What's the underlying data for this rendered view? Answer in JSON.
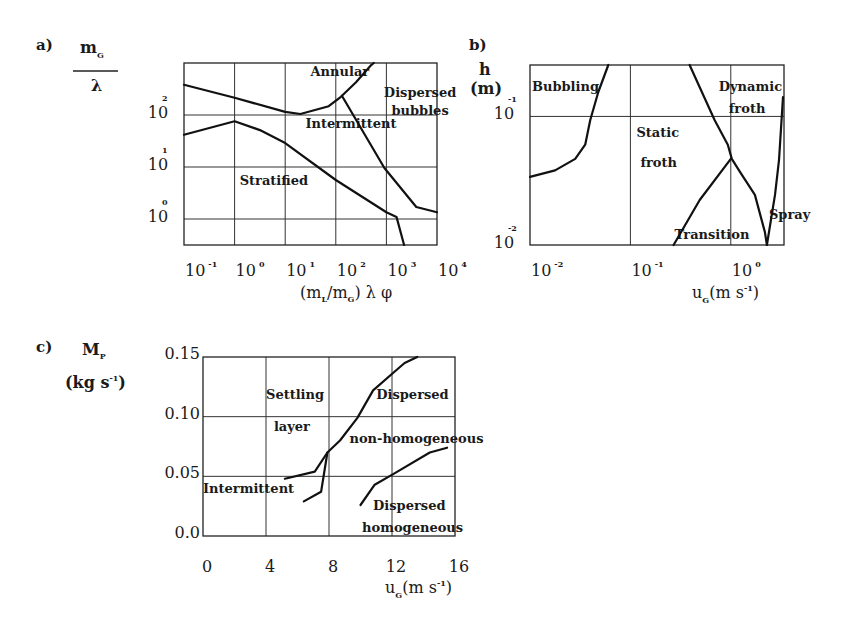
{
  "chart_data": [
    {
      "id": "a",
      "type": "line",
      "panel_label": "a)",
      "title": "",
      "xlabel": "(m_L/m_G) λ φ",
      "ylabel": "m_G / λ",
      "xscale": "log",
      "yscale": "log",
      "xlim_log10": [
        -1,
        4
      ],
      "ylim_log10": [
        -0.5,
        3.0
      ],
      "grid": true,
      "x_ticks": [
        {
          "base": "10",
          "exp": "-1",
          "log": -1
        },
        {
          "base": "10",
          "exp": "0",
          "log": 0
        },
        {
          "base": "10",
          "exp": "1",
          "log": 1
        },
        {
          "base": "10",
          "exp": "2",
          "log": 2
        },
        {
          "base": "10",
          "exp": "3",
          "log": 3
        },
        {
          "base": "10",
          "exp": "4",
          "log": 4
        }
      ],
      "y_ticks": [
        {
          "base": "10",
          "exp": "0",
          "log": 0
        },
        {
          "base": "10",
          "exp": "1",
          "log": 1
        },
        {
          "base": "10",
          "exp": "2",
          "log": 2
        }
      ],
      "series": [
        {
          "name": "annular-intermittent-boundary",
          "points_log10": [
            [
              -1,
              2.58
            ],
            [
              0,
              2.33
            ],
            [
              1,
              2.06
            ],
            [
              1.3,
              2.02
            ],
            [
              1.86,
              2.17
            ],
            [
              2.1,
              2.35
            ],
            [
              2.4,
              2.63
            ],
            [
              2.7,
              2.96
            ],
            [
              2.75,
              3.0
            ]
          ]
        },
        {
          "name": "intermittent-stratified-boundary",
          "points_log10": [
            [
              -1,
              1.62
            ],
            [
              0,
              1.88
            ],
            [
              0.5,
              1.71
            ],
            [
              1,
              1.46
            ],
            [
              2,
              0.75
            ],
            [
              3,
              0.13
            ],
            [
              3.2,
              0.04
            ],
            [
              3.35,
              -0.5
            ]
          ]
        },
        {
          "name": "dispersed-bubbles-boundary",
          "points_log10": [
            [
              2.12,
              2.37
            ],
            [
              2.96,
              0.98
            ],
            [
              3.59,
              0.23
            ],
            [
              4.0,
              0.13
            ]
          ]
        }
      ],
      "annotations": [
        {
          "text": "Annular",
          "at_log10": [
            1.5,
            2.75
          ]
        },
        {
          "text": "Dispersed",
          "at_log10": [
            2.95,
            2.35
          ]
        },
        {
          "text": "bubbles",
          "at_log10": [
            3.1,
            2.0
          ]
        },
        {
          "text": "Intermittent",
          "at_log10": [
            1.4,
            1.75
          ]
        },
        {
          "text": "Stratified",
          "at_log10": [
            0.1,
            0.65
          ]
        }
      ]
    },
    {
      "id": "b",
      "type": "line",
      "panel_label": "b)",
      "title": "",
      "xlabel": "u_G (m s^-1)",
      "ylabel": "h (m)",
      "xscale": "log",
      "yscale": "log",
      "xlim_log10": [
        -2,
        0.53
      ],
      "ylim_log10": [
        -2,
        -0.6
      ],
      "grid": true,
      "x_ticks": [
        {
          "base": "10",
          "exp": "-2",
          "log": -2
        },
        {
          "base": "10",
          "exp": "-1",
          "log": -1
        },
        {
          "base": "10",
          "exp": "0",
          "log": 0
        }
      ],
      "y_ticks": [
        {
          "base": "10",
          "exp": "-2",
          "log": -2
        },
        {
          "base": "10",
          "exp": "-1",
          "log": -1
        }
      ],
      "series": [
        {
          "name": "bubbling-boundary",
          "points_log10": [
            [
              -2,
              -1.47
            ],
            [
              -1.75,
              -1.42
            ],
            [
              -1.55,
              -1.33
            ],
            [
              -1.45,
              -1.22
            ],
            [
              -1.4,
              -1.03
            ],
            [
              -1.32,
              -0.81
            ],
            [
              -1.22,
              -0.6
            ]
          ]
        },
        {
          "name": "dynamic-froth-boundary",
          "points_log10": [
            [
              -0.41,
              -0.6
            ],
            [
              -0.16,
              -1.03
            ],
            [
              -0.03,
              -1.22
            ],
            [
              0.01,
              -1.33
            ],
            [
              0.09,
              -1.43
            ],
            [
              0.24,
              -1.61
            ],
            [
              0.34,
              -1.9
            ],
            [
              0.36,
              -2.0
            ]
          ]
        },
        {
          "name": "transition-boundary",
          "points_log10": [
            [
              -0.57,
              -2.0
            ],
            [
              -0.31,
              -1.65
            ],
            [
              0.0,
              -1.33
            ]
          ]
        },
        {
          "name": "spray-boundary",
          "points_log10": [
            [
              0.36,
              -2.0
            ],
            [
              0.44,
              -1.61
            ],
            [
              0.48,
              -1.34
            ],
            [
              0.52,
              -0.85
            ]
          ]
        }
      ],
      "annotations": [
        {
          "text": "Bubbling",
          "at_log10": [
            -1.98,
            -0.8
          ]
        },
        {
          "text": "Dynamic",
          "at_log10": [
            -0.12,
            -0.8
          ]
        },
        {
          "text": "froth",
          "at_log10": [
            -0.02,
            -0.97
          ]
        },
        {
          "text": "Static",
          "at_log10": [
            -0.94,
            -1.16
          ]
        },
        {
          "text": "froth",
          "at_log10": [
            -0.9,
            -1.39
          ]
        },
        {
          "text": "Transition",
          "at_log10": [
            -0.56,
            -1.95
          ]
        },
        {
          "text": "Spray",
          "at_log10": [
            0.38,
            -1.8
          ]
        }
      ]
    },
    {
      "id": "c",
      "type": "line",
      "panel_label": "c)",
      "title": "",
      "xlabel": "u_G (m s^-1)",
      "ylabel": "M_P (kg s^-1)",
      "xscale": "linear",
      "yscale": "linear",
      "xlim": [
        0,
        16
      ],
      "ylim": [
        0,
        0.15
      ],
      "grid": true,
      "x_ticks": [
        "0",
        "4",
        "8",
        "12",
        "16"
      ],
      "x_tick_values": [
        0,
        4,
        8,
        12,
        16
      ],
      "y_ticks": [
        "0.0",
        "0.05",
        "0.10",
        "0.15"
      ],
      "y_tick_values": [
        0,
        0.05,
        0.1,
        0.15
      ],
      "series": [
        {
          "name": "settling-dispersed-boundary",
          "points": [
            [
              5.2,
              0.048
            ],
            [
              7.1,
              0.054
            ],
            [
              7.9,
              0.07
            ],
            [
              8.7,
              0.08
            ],
            [
              9.8,
              0.099
            ],
            [
              10.8,
              0.122
            ],
            [
              12.1,
              0.137
            ],
            [
              12.8,
              0.145
            ],
            [
              13.6,
              0.15
            ]
          ]
        },
        {
          "name": "intermittent-boundary",
          "points": [
            [
              6.4,
              0.029
            ],
            [
              7.5,
              0.037
            ],
            [
              7.9,
              0.07
            ]
          ]
        },
        {
          "name": "homogeneous-boundary",
          "points": [
            [
              10.0,
              0.026
            ],
            [
              10.9,
              0.043
            ],
            [
              12.1,
              0.052
            ],
            [
              14.4,
              0.07
            ],
            [
              15.5,
              0.074
            ]
          ]
        }
      ],
      "annotations": [
        {
          "text": "Settling",
          "at": [
            4.0,
            0.115
          ]
        },
        {
          "text": "layer",
          "at": [
            4.5,
            0.088
          ]
        },
        {
          "text": "Dispersed",
          "at": [
            11.0,
            0.115
          ]
        },
        {
          "text": "non-homogeneous",
          "at": [
            9.3,
            0.078
          ]
        },
        {
          "text": "Intermittent",
          "at": [
            0.0,
            0.036
          ]
        },
        {
          "text": "Dispersed",
          "at": [
            10.8,
            0.022
          ]
        },
        {
          "text": "homogeneous",
          "at": [
            10.1,
            0.003
          ]
        }
      ]
    }
  ],
  "labels": {
    "a": {
      "panel": "a)",
      "ylabel_num_base": "m",
      "ylabel_num_sub": "G",
      "ylabel_den": "λ",
      "xlabel_open": "(m",
      "xlabel_sub1": "L",
      "xlabel_mid": "/m",
      "xlabel_sub2": "G",
      "xlabel_close": ") λ φ"
    },
    "b": {
      "panel": "b)",
      "ylabel_line1": "h",
      "ylabel_line2": "(m)",
      "xlabel_base": "u",
      "xlabel_sub": "G",
      "xlabel_rest": "(m  s",
      "xlabel_exp": "-1",
      "xlabel_close": ")"
    },
    "c": {
      "panel": "c)",
      "ylabel_base": "M",
      "ylabel_sub": "P",
      "ylabel_unit": "(kg  s",
      "ylabel_exp": "-1",
      "ylabel_close": ")",
      "xlabel_base": "u",
      "xlabel_sub": "G",
      "xlabel_rest": "(m  s",
      "xlabel_exp": "-1",
      "xlabel_close": ")"
    }
  }
}
